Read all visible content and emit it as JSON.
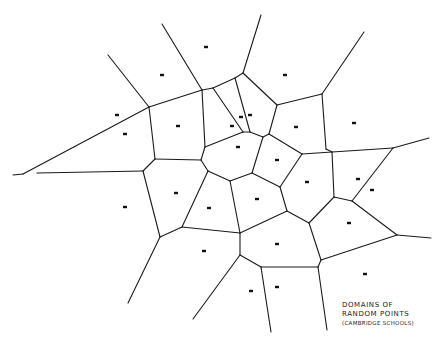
{
  "diagram": {
    "type": "voronoi",
    "width": 442,
    "height": 345,
    "line_color": "#1a1a1a",
    "point_color": "#111111",
    "caption": {
      "line1": "DOMAINS OF",
      "line2": "RANDOM POINTS",
      "line3": "(CAMBRIDGE SCHOOLS)"
    },
    "points": [
      [
        206,
        47
      ],
      [
        162,
        75
      ],
      [
        285,
        75
      ],
      [
        117,
        115
      ],
      [
        125,
        134
      ],
      [
        178,
        126
      ],
      [
        241,
        117
      ],
      [
        250,
        115
      ],
      [
        232,
        126
      ],
      [
        238,
        147
      ],
      [
        296,
        127
      ],
      [
        354,
        123
      ],
      [
        277,
        160
      ],
      [
        307,
        182
      ],
      [
        358,
        179
      ],
      [
        372,
        190
      ],
      [
        176,
        193
      ],
      [
        209,
        208
      ],
      [
        125,
        207
      ],
      [
        257,
        199
      ],
      [
        349,
        223
      ],
      [
        204,
        251
      ],
      [
        277,
        244
      ],
      [
        251,
        291
      ],
      [
        277,
        287
      ],
      [
        365,
        274
      ]
    ],
    "edges": [
      [
        [
          108,
          55
        ],
        [
          149,
          107
        ]
      ],
      [
        [
          162,
          24
        ],
        [
          202,
          90
        ]
      ],
      [
        [
          149,
          107
        ],
        [
          202,
          90
        ]
      ],
      [
        [
          202,
          90
        ],
        [
          213,
          88
        ]
      ],
      [
        [
          213,
          88
        ],
        [
          235,
          78
        ]
      ],
      [
        [
          235,
          78
        ],
        [
          243,
          73
        ]
      ],
      [
        [
          243,
          73
        ],
        [
          261,
          15
        ]
      ],
      [
        [
          243,
          73
        ],
        [
          277,
          105
        ]
      ],
      [
        [
          277,
          105
        ],
        [
          322,
          94
        ]
      ],
      [
        [
          322,
          94
        ],
        [
          364,
          32
        ]
      ],
      [
        [
          149,
          107
        ],
        [
          23,
          174
        ]
      ],
      [
        [
          13,
          175
        ],
        [
          23,
          174
        ]
      ],
      [
        [
          37,
          173
        ],
        [
          143,
          171
        ]
      ],
      [
        [
          149,
          107
        ],
        [
          155,
          159
        ]
      ],
      [
        [
          155,
          159
        ],
        [
          201,
          160
        ]
      ],
      [
        [
          143,
          171
        ],
        [
          155,
          159
        ]
      ],
      [
        [
          202,
          90
        ],
        [
          205,
          147
        ]
      ],
      [
        [
          205,
          147
        ],
        [
          201,
          160
        ]
      ],
      [
        [
          205,
          147
        ],
        [
          243,
          132
        ]
      ],
      [
        [
          213,
          88
        ],
        [
          243,
          132
        ]
      ],
      [
        [
          235,
          78
        ],
        [
          250,
          132
        ]
      ],
      [
        [
          243,
          132
        ],
        [
          250,
          132
        ]
      ],
      [
        [
          250,
          132
        ],
        [
          263,
          137
        ]
      ],
      [
        [
          263,
          137
        ],
        [
          269,
          134
        ]
      ],
      [
        [
          269,
          134
        ],
        [
          277,
          105
        ]
      ],
      [
        [
          201,
          160
        ],
        [
          208,
          171
        ]
      ],
      [
        [
          208,
          171
        ],
        [
          230,
          181
        ]
      ],
      [
        [
          230,
          181
        ],
        [
          252,
          173
        ]
      ],
      [
        [
          252,
          173
        ],
        [
          263,
          137
        ]
      ],
      [
        [
          269,
          134
        ],
        [
          302,
          154
        ]
      ],
      [
        [
          252,
          173
        ],
        [
          280,
          187
        ]
      ],
      [
        [
          280,
          187
        ],
        [
          302,
          154
        ]
      ],
      [
        [
          302,
          154
        ],
        [
          332,
          152
        ]
      ],
      [
        [
          322,
          94
        ],
        [
          326,
          149
        ]
      ],
      [
        [
          326,
          149
        ],
        [
          332,
          152
        ]
      ],
      [
        [
          332,
          152
        ],
        [
          393,
          148
        ]
      ],
      [
        [
          393,
          148
        ],
        [
          429,
          138
        ]
      ],
      [
        [
          332,
          152
        ],
        [
          334,
          197
        ]
      ],
      [
        [
          393,
          148
        ],
        [
          352,
          201
        ]
      ],
      [
        [
          334,
          197
        ],
        [
          352,
          201
        ]
      ],
      [
        [
          280,
          187
        ],
        [
          287,
          211
        ]
      ],
      [
        [
          287,
          211
        ],
        [
          309,
          223
        ]
      ],
      [
        [
          309,
          223
        ],
        [
          334,
          197
        ]
      ],
      [
        [
          352,
          201
        ],
        [
          397,
          235
        ]
      ],
      [
        [
          397,
          235
        ],
        [
          431,
          238
        ]
      ],
      [
        [
          143,
          171
        ],
        [
          160,
          237
        ]
      ],
      [
        [
          160,
          237
        ],
        [
          128,
          303
        ]
      ],
      [
        [
          208,
          171
        ],
        [
          182,
          227
        ]
      ],
      [
        [
          160,
          237
        ],
        [
          182,
          227
        ]
      ],
      [
        [
          182,
          227
        ],
        [
          240,
          233
        ]
      ],
      [
        [
          230,
          181
        ],
        [
          240,
          233
        ]
      ],
      [
        [
          240,
          233
        ],
        [
          287,
          211
        ]
      ],
      [
        [
          240,
          233
        ],
        [
          240,
          255
        ]
      ],
      [
        [
          240,
          255
        ],
        [
          193,
          319
        ]
      ],
      [
        [
          240,
          255
        ],
        [
          261,
          267
        ]
      ],
      [
        [
          261,
          267
        ],
        [
          271,
          332
        ]
      ],
      [
        [
          261,
          267
        ],
        [
          318,
          267
        ]
      ],
      [
        [
          309,
          223
        ],
        [
          321,
          260
        ]
      ],
      [
        [
          321,
          260
        ],
        [
          397,
          235
        ]
      ],
      [
        [
          321,
          260
        ],
        [
          318,
          267
        ]
      ],
      [
        [
          318,
          267
        ],
        [
          327,
          330
        ]
      ]
    ]
  }
}
